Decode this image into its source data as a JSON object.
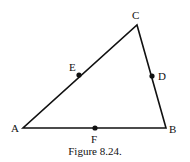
{
  "figure": {
    "caption": "Figure 8.24.",
    "stroke_color": "#111111",
    "vertices": {
      "A": {
        "label": "A",
        "x": 23,
        "y": 128
      },
      "B": {
        "label": "B",
        "x": 166,
        "y": 128
      },
      "C": {
        "label": "C",
        "x": 137,
        "y": 25
      }
    },
    "midpoints": {
      "E": {
        "label": "E",
        "x": 79,
        "y": 75,
        "side": "AC"
      },
      "D": {
        "label": "D",
        "x": 152,
        "y": 76,
        "side": "BC"
      },
      "F": {
        "label": "F",
        "x": 95,
        "y": 128,
        "side": "AB"
      }
    }
  }
}
